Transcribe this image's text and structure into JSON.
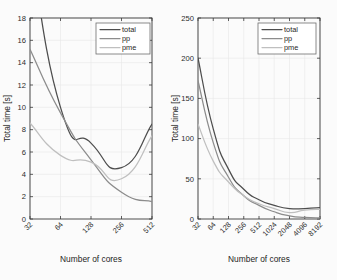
{
  "figure": {
    "background": "#fbfbfb",
    "axis_color": "#3a3a3a",
    "grid_color": "#e8e8e8"
  },
  "colors": {
    "total": "#4d4d4d",
    "pp": "#8c8c8c",
    "pme": "#bfbfbf"
  },
  "legend": {
    "position": "top-right",
    "entries": [
      {
        "label": "total",
        "color": "#4d4d4d"
      },
      {
        "label": "pp",
        "color": "#8c8c8c"
      },
      {
        "label": "pme",
        "color": "#bfbfbf"
      }
    ]
  },
  "chart_data": [
    {
      "id": "left",
      "type": "line",
      "title": "",
      "xlabel": "Number of cores",
      "ylabel": "Total time [s]",
      "xscale": "log2",
      "categories": [
        "32",
        "64",
        "128",
        "256",
        "512"
      ],
      "x": [
        32,
        64,
        128,
        256,
        512
      ],
      "xlim": [
        32,
        512
      ],
      "ylim": [
        0,
        18
      ],
      "yticks": [
        0,
        2,
        4,
        6,
        8,
        10,
        12,
        14,
        16,
        18
      ],
      "ytick_labels": [
        "0",
        "2",
        "4",
        "6",
        "8",
        "10",
        "12",
        "14",
        "16",
        "18"
      ],
      "grid": true,
      "clipped_top": true,
      "series": [
        {
          "name": "total",
          "color": "#4d4d4d",
          "values": [
            24.5,
            10.0,
            6.8,
            4.6,
            8.5
          ]
        },
        {
          "name": "pp",
          "color": "#8c8c8c",
          "values": [
            15.2,
            9.5,
            5.3,
            2.4,
            1.55
          ]
        },
        {
          "name": "pme",
          "color": "#bfbfbf",
          "values": [
            8.6,
            5.7,
            5.1,
            3.6,
            7.45
          ]
        }
      ]
    },
    {
      "id": "right",
      "type": "line",
      "title": "",
      "xlabel": "Number of cores",
      "ylabel": "Total time [s]",
      "xscale": "log2",
      "categories": [
        "32",
        "64",
        "128",
        "256",
        "512",
        "1024",
        "2048",
        "4096",
        "8192"
      ],
      "x": [
        32,
        64,
        128,
        256,
        512,
        1024,
        2048,
        4096,
        8192
      ],
      "xlim": [
        32,
        8192
      ],
      "ylim": [
        0,
        250
      ],
      "yticks": [
        0,
        50,
        100,
        150,
        200,
        250
      ],
      "ytick_labels": [
        "0",
        "50",
        "100",
        "150",
        "200",
        "250"
      ],
      "grid": true,
      "clipped_top": false,
      "series": [
        {
          "name": "total",
          "color": "#4d4d4d",
          "values": [
            200,
            112,
            62,
            37,
            24,
            17,
            13,
            13,
            14
          ]
        },
        {
          "name": "pp",
          "color": "#8c8c8c",
          "values": [
            172,
            95,
            52,
            29,
            17,
            9,
            4,
            2,
            1.5
          ]
        },
        {
          "name": "pme",
          "color": "#bfbfbf",
          "values": [
            118,
            72,
            46,
            29,
            19,
            13,
            8,
            11,
            12
          ]
        }
      ]
    }
  ]
}
